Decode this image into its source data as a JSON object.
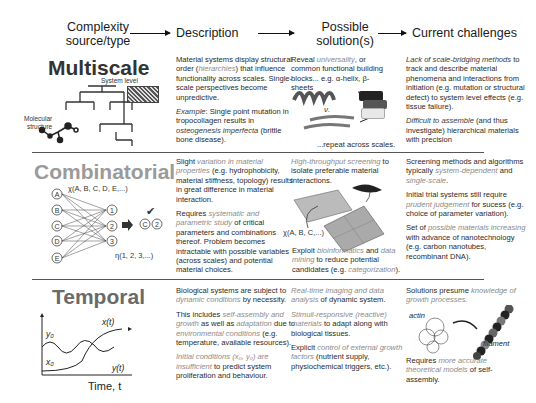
{
  "header": {
    "col1": [
      "Complexity",
      "source/type"
    ],
    "col2": "Description",
    "col3": [
      "Possible",
      "solution(s)"
    ],
    "col4": "Current challenges"
  },
  "rows": [
    {
      "category": "Multiscale",
      "category_color": "#333333",
      "figure_labels": {
        "system_level": "System level",
        "molecular": [
          "Molecular",
          "structure"
        ]
      },
      "description": [
        [
          {
            "t": "Material systems display structural order ("
          },
          {
            "t": "hierarchies",
            "s": "it"
          },
          {
            "t": ") that influence functionality across scales. Single-scale perspectives become unpredictive."
          }
        ],
        [
          {
            "t": "Example",
            "s": "itd"
          },
          {
            "t": ": Single point mutation in tropocollagen results in "
          },
          {
            "t": "osteogenesis imperfecta",
            "s": "itd"
          },
          {
            "t": " (brittle bone disease)."
          }
        ]
      ],
      "solution": [
        [
          {
            "t": "Reveal "
          },
          {
            "t": "universality",
            "s": "it"
          },
          {
            "t": ", or common functional building blocks... e.g. α-helix, β-sheets"
          }
        ]
      ],
      "solution_footer": "...repeat across scales.",
      "solution_figure_label": "ν.",
      "challenges": [
        [
          {
            "t": "Lack of scale-bridging methods",
            "s": "itd"
          },
          {
            "t": " to track and describe material phenomena and interactions from initiation (e.g. mutation or structural defect) to system level effects (e.g. tissue failure)."
          }
        ],
        [
          {
            "t": "Difficult to assemble",
            "s": "itd"
          },
          {
            "t": " (and thus investigate) hierarchical materials with precision"
          }
        ]
      ]
    },
    {
      "category": "Combinatorial",
      "category_color": "#9a9a9a",
      "figure_labels": {
        "chi": "χ(A, B, C, D, E,...)",
        "eta": "η(1, 2, 3,...)",
        "nodes_left": [
          "A",
          "B",
          "C",
          "D",
          "E"
        ],
        "nodes_right": [
          "1",
          "2",
          "3"
        ],
        "result": [
          "C",
          "2"
        ],
        "check": "✔"
      },
      "description": [
        [
          {
            "t": "Slight "
          },
          {
            "t": "variation in material properties",
            "s": "it"
          },
          {
            "t": " (e.g. hydrophobicity, material stiffness, topology) results in great difference in material interaction."
          }
        ],
        [
          {
            "t": "Requires "
          },
          {
            "t": "systematic and parametric study",
            "s": "it"
          },
          {
            "t": " of critical parameters and combinations thereof. Problem becomes intractable with possible variables (across scales) and potential material choices."
          }
        ]
      ],
      "solution": [
        [
          {
            "t": "High-throughput screening",
            "s": "it"
          },
          {
            "t": " to isolate preferable material interactions."
          }
        ]
      ],
      "solution_figure_label": "χ(A, B, C,...)",
      "solution_after": [
        [
          {
            "t": "Exploit "
          },
          {
            "t": "bioinformatics",
            "s": "it"
          },
          {
            "t": " and "
          },
          {
            "t": "data mining",
            "s": "it"
          },
          {
            "t": " to reduce potential candidates (e.g. "
          },
          {
            "t": "categorization",
            "s": "it"
          },
          {
            "t": ")."
          }
        ]
      ],
      "challenges": [
        [
          {
            "t": "Screening methods and algorithms typically "
          },
          {
            "t": "system-dependent",
            "s": "it"
          },
          {
            "t": " and "
          },
          {
            "t": "single-scale",
            "s": "it"
          },
          {
            "t": "."
          }
        ],
        [
          {
            "t": "Initial trial systems still require "
          },
          {
            "t": "prudent judgement",
            "s": "it"
          },
          {
            "t": " for sucess (e.g. choice of parameter variation)."
          }
        ],
        [
          {
            "t": "Set of "
          },
          {
            "t": "possible materials increasing",
            "s": "it"
          },
          {
            "t": " with advance of nanotechnology (e.g. carbon nanotubes, recombinant DNA)."
          }
        ]
      ]
    },
    {
      "category": "Temporal",
      "category_color": "#6a6a6a",
      "figure_labels": {
        "x_t": "x(t)",
        "y_t": "y(t)",
        "y0": "y₀",
        "x0": "x₀",
        "axis": "Time, t"
      },
      "description": [
        [
          {
            "t": "Biological systems are subject to "
          },
          {
            "t": "dynamic conditions",
            "s": "it"
          },
          {
            "t": " by necessity."
          }
        ],
        [
          {
            "t": "This includes "
          },
          {
            "t": "self-assembly and growth",
            "s": "it"
          },
          {
            "t": " as well as "
          },
          {
            "t": "adaptation",
            "s": "it"
          },
          {
            "t": " due to "
          },
          {
            "t": "environmental conditions",
            "s": "it"
          },
          {
            "t": " (e.g. temperature, available resources)."
          }
        ],
        [
          {
            "t": "Initial conditions (x₀, y₀) are insufficient",
            "s": "it"
          },
          {
            "t": " to predict system proliferation and behaviour."
          }
        ]
      ],
      "solution": [
        [
          {
            "t": "Real-time imaging and data analysis",
            "s": "it"
          },
          {
            "t": " of dynamic system."
          }
        ],
        [
          {
            "t": "Stimuli-responsive (reactive) materials",
            "s": "it"
          },
          {
            "t": " to adapt along with biological tissues."
          }
        ],
        [
          {
            "t": "Explicit "
          },
          {
            "t": "control of external growth factors",
            "s": "it"
          },
          {
            "t": " (nutrient supply, physiochemical triggers, etc.)."
          }
        ]
      ],
      "challenges_top": [
        [
          {
            "t": "Solutions presume "
          },
          {
            "t": "knowledge of growth processes.",
            "s": "it"
          }
        ]
      ],
      "challenge_figure_labels": {
        "actin": "actin",
        "filament": "filament"
      },
      "challenges_bottom": [
        [
          {
            "t": "Requires "
          },
          {
            "t": "more accurate theoretical models",
            "s": "it"
          },
          {
            "t": " of self-assembly."
          }
        ]
      ]
    }
  ]
}
